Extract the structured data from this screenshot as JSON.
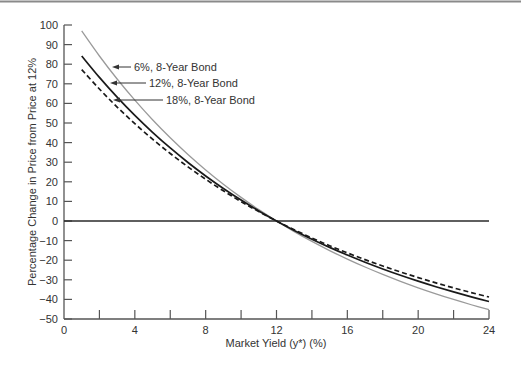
{
  "chart_data": {
    "type": "line",
    "title": "",
    "xlabel": "Market Yield (y*) (%)",
    "ylabel": "Percentage Change in Price from Price at 12%",
    "xlim": [
      0,
      24
    ],
    "ylim": [
      -50,
      100
    ],
    "x_ticks": [
      0,
      2,
      4,
      6,
      8,
      10,
      12,
      14,
      16,
      18,
      20,
      22,
      24
    ],
    "x_tick_labels": [
      "0",
      "",
      "4",
      "",
      "8",
      "",
      "12",
      "",
      "16",
      "",
      "20",
      "",
      "24"
    ],
    "y_ticks": [
      100,
      90,
      80,
      70,
      60,
      50,
      40,
      30,
      20,
      10,
      0,
      -10,
      -20,
      -30,
      -40,
      -50
    ],
    "y_tick_labels": [
      "100",
      "90",
      "80",
      "70",
      "60",
      "50",
      "40",
      "30",
      "20",
      "10",
      "0",
      "−10",
      "−20",
      "−30",
      "−40",
      "−50"
    ],
    "grid": false,
    "legend_position": "inline annotations with arrows",
    "reference_line": {
      "y": 0,
      "x_from": 0,
      "x_to": 24
    },
    "x": [
      1,
      2,
      3,
      4,
      5,
      6,
      7,
      8,
      9,
      10,
      11,
      12,
      13,
      14,
      15,
      16,
      17,
      18,
      19,
      20,
      21,
      22,
      23,
      24
    ],
    "series": [
      {
        "name": "6%, 8-Year Bond",
        "style": "solid",
        "color": "#9a9a9a",
        "values": [
          96.95,
          84.19,
          72.45,
          61.64,
          51.65,
          42.45,
          33.94,
          26.08,
          18.8,
          12.05,
          5.79,
          0,
          -5.4,
          -10.41,
          -15.09,
          -19.43,
          -23.48,
          -27.25,
          -30.78,
          -34.07,
          -37.15,
          -40.04,
          -42.73,
          -45.27
        ]
      },
      {
        "name": "12%, 8-Year Bond",
        "style": "solid",
        "color": "#1a1a1a",
        "values": [
          84.17,
          73.26,
          63.18,
          53.86,
          45.24,
          37.26,
          29.86,
          22.99,
          16.6,
          10.67,
          5.15,
          0,
          -4.8,
          -9.28,
          -13.46,
          -17.37,
          -21.04,
          -24.46,
          -27.68,
          -30.7,
          -33.53,
          -36.19,
          -38.7,
          -41.06
        ]
      },
      {
        "name": "18%, 8-Year Bond",
        "style": "dashed",
        "color": "#1a1a1a",
        "values": [
          77.24,
          67.33,
          58.15,
          49.65,
          41.76,
          34.44,
          27.64,
          21.31,
          15.41,
          9.91,
          4.79,
          0,
          -4.48,
          -8.67,
          -12.59,
          -16.27,
          -19.72,
          -22.96,
          -26.01,
          -28.87,
          -31.58,
          -34.12,
          -36.52,
          -38.78
        ]
      }
    ],
    "annotations": [
      {
        "text": "6%, 8-Year Bond",
        "series": 0,
        "arrow_tip": [
          112,
          67
        ],
        "line_end": 131,
        "text_x": 134,
        "text_y": 67
      },
      {
        "text": "12%, 8-Year Bond",
        "series": 1,
        "arrow_tip": [
          110,
          83
        ],
        "line_end": 146,
        "text_x": 149,
        "text_y": 83
      },
      {
        "text": "18%, 8-Year Bond",
        "series": 2,
        "arrow_tip": [
          113,
          100
        ],
        "line_end": 163,
        "text_x": 166,
        "text_y": 100
      }
    ]
  },
  "labels": {
    "xlabel": "Market Yield (y*) (%)",
    "ylabel": "Percentage Change in Price from Price at 12%"
  },
  "colors": {
    "axis": "#555555",
    "zero_line": "#2a2a2a",
    "top_rule": "#8a8a8a",
    "series_6": "#9a9a9a",
    "series_12": "#1a1a1a",
    "series_18": "#1a1a1a"
  }
}
